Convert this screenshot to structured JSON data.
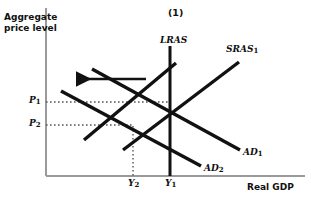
{
  "figure": {
    "panel_title": "(1)",
    "type": "AD-AS macroeconomic equilibrium diagram",
    "background": "#ffffff",
    "curve_color": "#111111",
    "axis_color": "#9a9a9a",
    "guide_color": "#4d4d4d"
  },
  "axes": {
    "y_title_line1": "Aggregate",
    "y_title_line2": "price level",
    "x_title": "Real GDP",
    "origin_px": {
      "x": 46,
      "y": 176
    },
    "x_end_px": 305,
    "y_top_px": 8
  },
  "ticks": {
    "y": [
      {
        "id": "P1",
        "label": "P",
        "sub": "1",
        "y_px": 102
      },
      {
        "id": "P2",
        "label": "P",
        "sub": "2",
        "y_px": 125
      }
    ],
    "x": [
      {
        "id": "Y2",
        "label": "Y",
        "sub": "2",
        "x_px": 133
      },
      {
        "id": "Y1",
        "label": "Y",
        "sub": "1",
        "x_px": 170
      }
    ]
  },
  "curves": [
    {
      "id": "LRAS",
      "label": "LRAS",
      "sub": "",
      "kind": "vertical",
      "x1": 170,
      "y1": 46,
      "x2": 170,
      "y2": 176,
      "label_x": 160,
      "label_y": 36
    },
    {
      "id": "SRAS1",
      "label": "SRAS",
      "sub": "1",
      "kind": "upward-sloping",
      "x1": 123,
      "y1": 150,
      "x2": 239,
      "y2": 62,
      "label_x": 226,
      "label_y": 45
    },
    {
      "id": "SRAS2",
      "label": "",
      "sub": "",
      "kind": "upward-sloping-shifted-left",
      "x1": 84,
      "y1": 140,
      "x2": 176,
      "y2": 63,
      "label_x": 0,
      "label_y": 0
    },
    {
      "id": "AD1",
      "label": "AD",
      "sub": "1",
      "kind": "downward-sloping",
      "x1": 92,
      "y1": 69,
      "x2": 240,
      "y2": 150,
      "label_x": 243,
      "label_y": 148
    },
    {
      "id": "AD2",
      "label": "AD",
      "sub": "2",
      "kind": "downward-sloping",
      "x1": 61,
      "y1": 91,
      "x2": 201,
      "y2": 166,
      "label_x": 204,
      "label_y": 164
    }
  ],
  "equilibria": [
    {
      "id": "E1",
      "x_px": 170,
      "y_px": 101
    },
    {
      "id": "E2",
      "x_px": 133,
      "y_px": 126
    }
  ],
  "shift_arrow": {
    "id": "leftward-shift-arrow",
    "direction": "left",
    "x_start": 146,
    "x_end": 76,
    "y": 79
  }
}
